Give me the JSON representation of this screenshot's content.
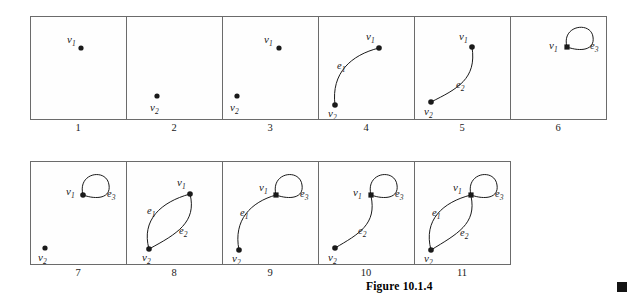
{
  "figure": {
    "caption": "Figure 10.1.4",
    "end_marker": "filled-square",
    "panel_size": {
      "width": 96,
      "height": 103
    },
    "ink_color": "#1a1a1a",
    "border_color": "#6b6b6b",
    "background": "#ffffff"
  },
  "labels": {
    "v1": "v",
    "v1_sub": "1",
    "v2": "v",
    "v2_sub": "2",
    "e1": "e",
    "e1_sub": "1",
    "e2": "e",
    "e2_sub": "2",
    "e3": "e",
    "e3_sub": "3"
  },
  "rows": [
    {
      "name": "row-1",
      "panels": [
        {
          "number": "1",
          "vertices": [
            "v1"
          ],
          "edges": []
        },
        {
          "number": "2",
          "vertices": [
            "v2"
          ],
          "edges": []
        },
        {
          "number": "3",
          "vertices": [
            "v1",
            "v2"
          ],
          "edges": []
        },
        {
          "number": "4",
          "vertices": [
            "v1",
            "v2"
          ],
          "edges": [
            "e1"
          ]
        },
        {
          "number": "5",
          "vertices": [
            "v1",
            "v2"
          ],
          "edges": [
            "e2"
          ]
        },
        {
          "number": "6",
          "vertices": [
            "v1"
          ],
          "edges": [
            "e3"
          ]
        }
      ]
    },
    {
      "name": "row-2",
      "panels": [
        {
          "number": "7",
          "vertices": [
            "v1",
            "v2"
          ],
          "edges": [
            "e3"
          ]
        },
        {
          "number": "8",
          "vertices": [
            "v1",
            "v2"
          ],
          "edges": [
            "e1",
            "e2"
          ]
        },
        {
          "number": "9",
          "vertices": [
            "v1",
            "v2"
          ],
          "edges": [
            "e1",
            "e3"
          ]
        },
        {
          "number": "10",
          "vertices": [
            "v1",
            "v2"
          ],
          "edges": [
            "e2",
            "e3"
          ]
        },
        {
          "number": "11",
          "vertices": [
            "v1",
            "v2"
          ],
          "edges": [
            "e1",
            "e2",
            "e3"
          ]
        }
      ]
    }
  ]
}
